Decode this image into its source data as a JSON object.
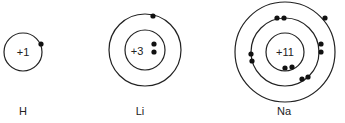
{
  "atoms": [
    {
      "symbol": "H",
      "nucleus_charge": "+1",
      "shells": [
        1
      ]
    },
    {
      "symbol": "Li",
      "nucleus_charge": "+3",
      "shells": [
        2,
        1
      ]
    },
    {
      "symbol": "Na",
      "nucleus_charge": "+11",
      "shells": [
        2,
        8,
        1
      ]
    }
  ],
  "colors": {
    "line": "#222222",
    "electron": "#111111",
    "background": "#ffffff"
  }
}
